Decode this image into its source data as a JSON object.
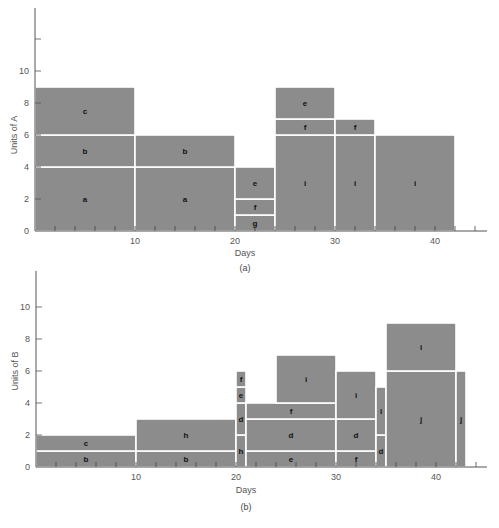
{
  "chart_data": [
    {
      "type": "bar",
      "subtype": "stacked-resource-histogram",
      "caption": "(a)",
      "xlabel": "Days",
      "ylabel": "Units of A",
      "xlim": [
        0,
        45
      ],
      "ylim": [
        0,
        12
      ],
      "xticks_labeled": [
        10,
        20,
        30,
        40
      ],
      "yticks_labeled": [
        0,
        2,
        4,
        6,
        8,
        10
      ],
      "ytick_unlabeled_top": 12,
      "minor_xtick_step": 2,
      "grid": false,
      "bar_color": "#8c8c8c",
      "divider_color": "#ffffff",
      "segments": [
        {
          "activity": "a",
          "start": 0,
          "end": 10,
          "bottom": 0,
          "top": 4
        },
        {
          "activity": "b",
          "start": 0,
          "end": 10,
          "bottom": 4,
          "top": 6
        },
        {
          "activity": "c",
          "start": 0,
          "end": 10,
          "bottom": 6,
          "top": 9
        },
        {
          "activity": "a",
          "start": 10,
          "end": 20,
          "bottom": 0,
          "top": 4
        },
        {
          "activity": "b",
          "start": 10,
          "end": 20,
          "bottom": 4,
          "top": 6
        },
        {
          "activity": "g",
          "start": 20,
          "end": 24,
          "bottom": 0,
          "top": 1
        },
        {
          "activity": "f",
          "start": 20,
          "end": 24,
          "bottom": 1,
          "top": 2
        },
        {
          "activity": "e",
          "start": 20,
          "end": 24,
          "bottom": 2,
          "top": 4
        },
        {
          "activity": "i",
          "start": 24,
          "end": 30,
          "bottom": 0,
          "top": 6
        },
        {
          "activity": "f",
          "start": 24,
          "end": 30,
          "bottom": 6,
          "top": 7
        },
        {
          "activity": "e",
          "start": 24,
          "end": 30,
          "bottom": 7,
          "top": 9
        },
        {
          "activity": "i",
          "start": 30,
          "end": 34,
          "bottom": 0,
          "top": 6
        },
        {
          "activity": "f",
          "start": 30,
          "end": 34,
          "bottom": 6,
          "top": 7
        },
        {
          "activity": "i",
          "start": 34,
          "end": 42,
          "bottom": 0,
          "top": 6
        }
      ],
      "totals_by_period": [
        {
          "start": 0,
          "end": 10,
          "units": 9
        },
        {
          "start": 10,
          "end": 20,
          "units": 6
        },
        {
          "start": 20,
          "end": 24,
          "units": 4
        },
        {
          "start": 24,
          "end": 30,
          "units": 9
        },
        {
          "start": 30,
          "end": 34,
          "units": 7
        },
        {
          "start": 34,
          "end": 42,
          "units": 6
        }
      ]
    },
    {
      "type": "bar",
      "subtype": "stacked-resource-histogram",
      "caption": "(b)",
      "xlabel": "Days",
      "ylabel": "Units of B",
      "xlim": [
        0,
        45
      ],
      "ylim": [
        0,
        12
      ],
      "xticks_labeled": [
        10,
        20,
        30,
        40
      ],
      "yticks_labeled": [
        0,
        2,
        4,
        6,
        8,
        10
      ],
      "minor_xtick_step": 2,
      "grid": false,
      "bar_color": "#8c8c8c",
      "divider_color": "#ffffff",
      "segments": [
        {
          "activity": "b",
          "start": 0,
          "end": 10,
          "bottom": 0,
          "top": 1
        },
        {
          "activity": "c",
          "start": 0,
          "end": 10,
          "bottom": 1,
          "top": 2
        },
        {
          "activity": "b",
          "start": 10,
          "end": 20,
          "bottom": 0,
          "top": 1
        },
        {
          "activity": "h",
          "start": 10,
          "end": 20,
          "bottom": 1,
          "top": 3
        },
        {
          "activity": "h",
          "start": 20,
          "end": 21,
          "bottom": 0,
          "top": 2
        },
        {
          "activity": "d",
          "start": 20,
          "end": 21,
          "bottom": 2,
          "top": 4
        },
        {
          "activity": "e",
          "start": 20,
          "end": 21,
          "bottom": 4,
          "top": 5
        },
        {
          "activity": "f",
          "start": 20,
          "end": 21,
          "bottom": 5,
          "top": 6
        },
        {
          "activity": "e",
          "start": 21,
          "end": 30,
          "bottom": 0,
          "top": 1
        },
        {
          "activity": "d",
          "start": 21,
          "end": 30,
          "bottom": 1,
          "top": 3
        },
        {
          "activity": "f",
          "start": 21,
          "end": 30,
          "bottom": 3,
          "top": 4
        },
        {
          "activity": "i",
          "start": 24,
          "end": 30,
          "bottom": 4,
          "top": 7
        },
        {
          "activity": "f",
          "start": 30,
          "end": 34,
          "bottom": 0,
          "top": 1
        },
        {
          "activity": "d",
          "start": 30,
          "end": 34,
          "bottom": 1,
          "top": 3
        },
        {
          "activity": "i",
          "start": 30,
          "end": 34,
          "bottom": 3,
          "top": 6
        },
        {
          "activity": "d",
          "start": 34,
          "end": 35,
          "bottom": 0,
          "top": 2
        },
        {
          "activity": "i",
          "start": 34,
          "end": 35,
          "bottom": 2,
          "top": 5
        },
        {
          "activity": "j",
          "start": 35,
          "end": 42,
          "bottom": 0,
          "top": 6
        },
        {
          "activity": "i",
          "start": 35,
          "end": 42,
          "bottom": 6,
          "top": 9
        },
        {
          "activity": "j",
          "start": 42,
          "end": 43,
          "bottom": 0,
          "top": 6
        }
      ],
      "totals_by_period": [
        {
          "start": 0,
          "end": 10,
          "units": 2
        },
        {
          "start": 10,
          "end": 20,
          "units": 3
        },
        {
          "start": 20,
          "end": 21,
          "units": 6
        },
        {
          "start": 21,
          "end": 24,
          "units": 4
        },
        {
          "start": 24,
          "end": 30,
          "units": 7
        },
        {
          "start": 30,
          "end": 34,
          "units": 6
        },
        {
          "start": 34,
          "end": 35,
          "units": 5
        },
        {
          "start": 35,
          "end": 42,
          "units": 9
        },
        {
          "start": 42,
          "end": 43,
          "units": 6
        }
      ]
    }
  ]
}
